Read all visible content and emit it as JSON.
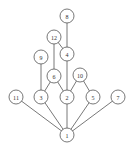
{
  "diagram": {
    "type": "hasse-diagram",
    "node_radius": 7,
    "colors": {
      "stroke": "#555555",
      "fill": "#ffffff",
      "text": "#333333"
    },
    "nodes": [
      {
        "id": "8",
        "label": "8",
        "x": 67,
        "y": 16
      },
      {
        "id": "12",
        "label": "12",
        "x": 54,
        "y": 37
      },
      {
        "id": "4",
        "label": "4",
        "x": 67,
        "y": 54
      },
      {
        "id": "9",
        "label": "9",
        "x": 41,
        "y": 57
      },
      {
        "id": "6",
        "label": "6",
        "x": 54,
        "y": 76
      },
      {
        "id": "10",
        "label": "10",
        "x": 80,
        "y": 75
      },
      {
        "id": "11",
        "label": "11",
        "x": 16,
        "y": 97
      },
      {
        "id": "3",
        "label": "3",
        "x": 41,
        "y": 97
      },
      {
        "id": "2",
        "label": "2",
        "x": 67,
        "y": 97
      },
      {
        "id": "5",
        "label": "5",
        "x": 93,
        "y": 97
      },
      {
        "id": "7",
        "label": "7",
        "x": 118,
        "y": 97
      },
      {
        "id": "1",
        "label": "1",
        "x": 67,
        "y": 135
      }
    ],
    "edges": [
      [
        "8",
        "4"
      ],
      [
        "12",
        "4"
      ],
      [
        "12",
        "6"
      ],
      [
        "4",
        "2"
      ],
      [
        "9",
        "3"
      ],
      [
        "6",
        "3"
      ],
      [
        "6",
        "2"
      ],
      [
        "10",
        "2"
      ],
      [
        "10",
        "5"
      ],
      [
        "11",
        "1"
      ],
      [
        "3",
        "1"
      ],
      [
        "2",
        "1"
      ],
      [
        "5",
        "1"
      ],
      [
        "7",
        "1"
      ]
    ]
  }
}
